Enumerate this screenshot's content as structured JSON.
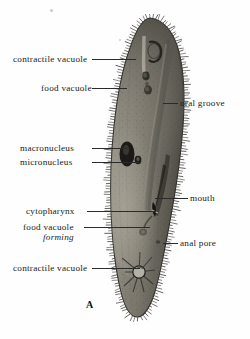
{
  "figure": {
    "letter": "A",
    "organism": "paramecium",
    "view": "diagram of paramecium internal anatomy",
    "ink_color": "#2b2b2b",
    "background_color": "#fefefe",
    "body_color": "#8d8a80"
  },
  "labels": [
    {
      "id": "contractile-vacuole-top",
      "text": "contractile vacuole",
      "side": "left",
      "x": 13,
      "y": 54,
      "leader": {
        "x": 92,
        "y": 59,
        "w": 44
      }
    },
    {
      "id": "food-vacuole-top",
      "text": "food vacuole",
      "side": "left",
      "x": 41,
      "y": 83,
      "leader": {
        "x": 92,
        "y": 88,
        "w": 35
      }
    },
    {
      "id": "oral-groove",
      "text": "oral groove",
      "side": "right",
      "x": 180,
      "y": 98,
      "leader": {
        "x": 163,
        "y": 103,
        "w": 15
      }
    },
    {
      "id": "macronucleus",
      "text": "macronucleus",
      "side": "left",
      "x": 20,
      "y": 143,
      "leader": {
        "x": 92,
        "y": 148,
        "w": 35
      }
    },
    {
      "id": "micronucleus",
      "text": "micronucleus",
      "side": "left",
      "x": 20,
      "y": 157,
      "leader": {
        "x": 92,
        "y": 162,
        "w": 47
      }
    },
    {
      "id": "mouth",
      "text": "mouth",
      "side": "right",
      "x": 190,
      "y": 193,
      "leader": {
        "x": 155,
        "y": 198,
        "w": 33
      }
    },
    {
      "id": "cytopharynx",
      "text": "cytopharynx",
      "side": "left",
      "x": 26,
      "y": 206,
      "leader": {
        "x": 87,
        "y": 211,
        "w": 69
      }
    },
    {
      "id": "food-vacuole-forming",
      "text": "food vacuole",
      "side": "left",
      "x": 23,
      "y": 222,
      "leader": {
        "x": 84,
        "y": 227,
        "w": 66
      }
    },
    {
      "id": "food-vacuole-forming-2",
      "text": "forming",
      "side": "left",
      "x": 43,
      "y": 232,
      "leader": null
    },
    {
      "id": "anal-pore",
      "text": "anal pore",
      "side": "right",
      "x": 180,
      "y": 238,
      "leader": {
        "x": 163,
        "y": 243,
        "w": 15
      }
    },
    {
      "id": "contractile-vacuole-bottom",
      "text": "contractile vacuole",
      "side": "left",
      "x": 13,
      "y": 263,
      "leader": {
        "x": 92,
        "y": 268,
        "w": 48
      }
    }
  ],
  "anatomy_parts": [
    "contractile vacuole (anterior)",
    "food vacuole",
    "oral groove",
    "macronucleus",
    "micronucleus",
    "mouth",
    "cytopharynx",
    "food vacuole forming",
    "anal pore",
    "contractile vacuole (posterior)"
  ]
}
